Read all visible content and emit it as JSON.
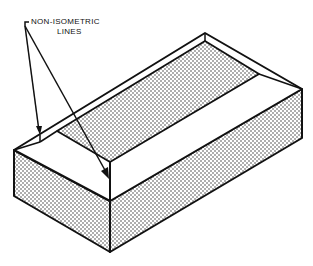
{
  "diagram": {
    "annotation": {
      "line1": "NON-ISOMETRIC",
      "line2": "LINES"
    },
    "colors": {
      "stroke": "#111111",
      "background": "#ffffff",
      "dot": "#333333"
    }
  }
}
